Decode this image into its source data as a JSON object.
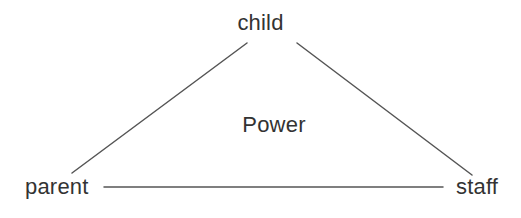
{
  "diagram": {
    "type": "triangle-relationship-diagram",
    "center_label": "Power",
    "nodes": [
      {
        "id": "child",
        "label": "child"
      },
      {
        "id": "parent",
        "label": "parent"
      },
      {
        "id": "staff",
        "label": "staff"
      }
    ],
    "edges": [
      {
        "from": "parent",
        "to": "child"
      },
      {
        "from": "child",
        "to": "staff"
      },
      {
        "from": "parent",
        "to": "staff"
      }
    ],
    "colors": {
      "background": "#ffffff",
      "line": "#555555",
      "text": "#333333"
    }
  }
}
